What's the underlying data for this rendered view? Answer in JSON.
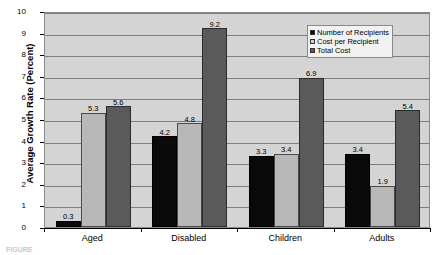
{
  "chart_data": {
    "type": "bar",
    "title": "",
    "xlabel": "",
    "ylabel": "Average Growth Rate (Percent)",
    "ylim": [
      0,
      10
    ],
    "ytick_labels": [
      "0",
      "1",
      "2",
      "3",
      "4",
      "5",
      "6",
      "7",
      "8",
      "9",
      "10"
    ],
    "grid": true,
    "legend_position": "top-right",
    "categories": [
      "Aged",
      "Disabled",
      "Children",
      "Adults"
    ],
    "series": [
      {
        "name": "Number of Recipients",
        "color": "#0a0a0a",
        "values": [
          0.3,
          4.2,
          3.3,
          3.4
        ]
      },
      {
        "name": "Cost per Recipient",
        "color": "#b8b8b8",
        "values": [
          5.3,
          4.8,
          3.4,
          1.9
        ]
      },
      {
        "name": "Total Cost",
        "color": "#5a5a5a",
        "values": [
          5.6,
          9.2,
          6.9,
          5.4
        ]
      }
    ]
  },
  "caption": "FIGURE"
}
